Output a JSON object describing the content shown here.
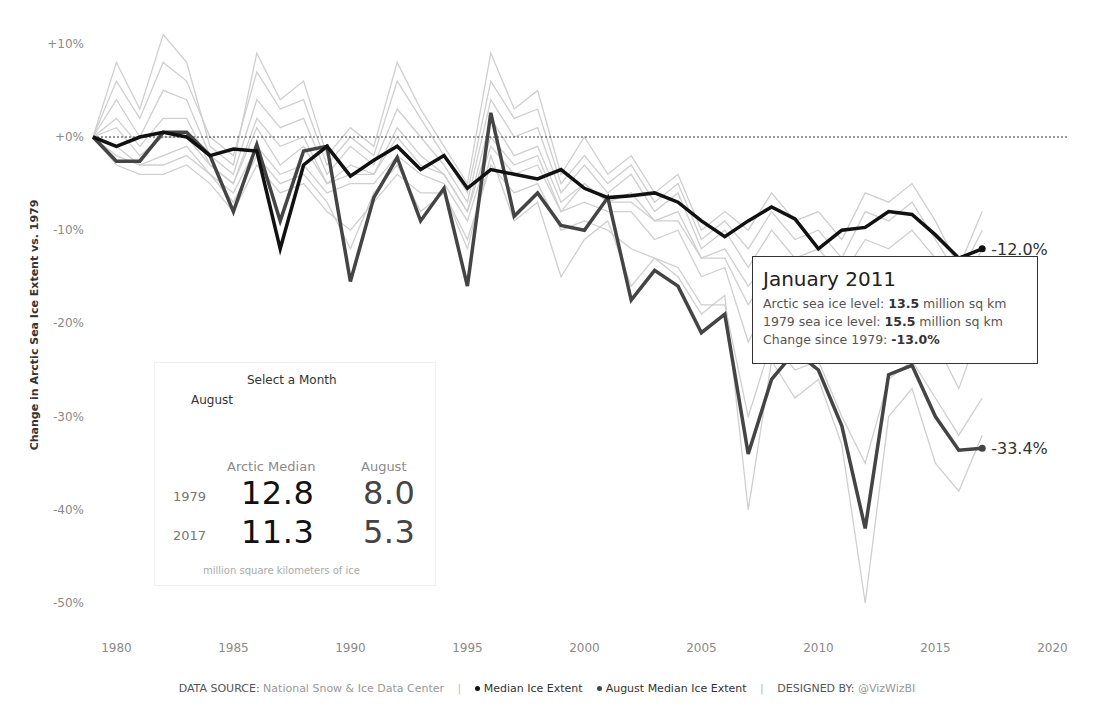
{
  "chart_data": {
    "type": "line",
    "title": "",
    "xlabel": "",
    "ylabel": "Change in Arctic Sea Ice Extent vs. 1979",
    "xlim": [
      1979,
      2020
    ],
    "ylim": [
      -50,
      10
    ],
    "grid": false,
    "reference_line": {
      "y": 0,
      "style": "dotted"
    },
    "x_ticks": [
      "1980",
      "1985",
      "1990",
      "1995",
      "2000",
      "2005",
      "2010",
      "2015",
      "2020"
    ],
    "y_ticks": [
      "+10%",
      "+0%",
      "-10%",
      "-20%",
      "-30%",
      "-40%",
      "-50%"
    ],
    "x": [
      1979,
      1980,
      1981,
      1982,
      1983,
      1984,
      1985,
      1986,
      1987,
      1988,
      1989,
      1990,
      1991,
      1992,
      1993,
      1994,
      1995,
      1996,
      1997,
      1998,
      1999,
      2000,
      2001,
      2002,
      2003,
      2004,
      2005,
      2006,
      2007,
      2008,
      2009,
      2010,
      2011,
      2012,
      2013,
      2014,
      2015,
      2016,
      2017
    ],
    "series": [
      {
        "name": "Median Ice Extent",
        "color": "#111111",
        "width": 3.5,
        "end_label": "-12.0%",
        "values": [
          0,
          -1,
          0,
          0.5,
          0,
          -2,
          -1.3,
          -1.5,
          -12,
          -3,
          -1,
          -4.2,
          -2.5,
          -1,
          -3.5,
          -2,
          -5.5,
          -3.5,
          -4,
          -4.5,
          -3.5,
          -5.5,
          -6.5,
          -6.3,
          -6,
          -7,
          -9,
          -10.7,
          -9,
          -7.5,
          -8.8,
          -12,
          -10,
          -9.7,
          -8,
          -8.3,
          -10.5,
          -13,
          -12
        ]
      },
      {
        "name": "August Median Ice Extent",
        "color": "#444444",
        "width": 3.5,
        "end_label": "-33.4%",
        "values": [
          0,
          -2.6,
          -2.6,
          0.5,
          0.5,
          -2,
          -8,
          -0.8,
          -9,
          -1.5,
          -1,
          -15.5,
          -6.5,
          -2.2,
          -9,
          -5.5,
          -16,
          2.6,
          -8.5,
          -6,
          -9.5,
          -10,
          -6.5,
          -17.5,
          -14.3,
          -16,
          -21,
          -19,
          -34,
          -26,
          -23,
          -25,
          -31,
          -42,
          -25.5,
          -24.5,
          -30,
          -33.6,
          -33.4
        ]
      }
    ],
    "background_series_color": "#cfcfcf",
    "background_series": [
      {
        "name": "other-month-1",
        "values": [
          0,
          8,
          3,
          11,
          8,
          -1,
          -3,
          9,
          4,
          6,
          -2,
          1,
          -1,
          8,
          3,
          -1,
          -5,
          9,
          3,
          5,
          -4,
          0,
          -4,
          -2,
          -6,
          -4,
          -10,
          -8,
          -10,
          -6,
          -9,
          -8,
          -11,
          -6,
          -7,
          -5,
          -9,
          -14,
          -8
        ]
      },
      {
        "name": "other-month-2",
        "values": [
          0,
          6,
          2,
          8,
          6,
          0,
          -2,
          7,
          3,
          4,
          -3,
          0,
          -2,
          6,
          2,
          -2,
          -6,
          6,
          2,
          3,
          -5,
          -2,
          -5,
          -3,
          -7,
          -5,
          -11,
          -9,
          -12,
          -8,
          -11,
          -10,
          -13,
          -8,
          -9,
          -7,
          -11,
          -15,
          -10
        ]
      },
      {
        "name": "other-month-3",
        "values": [
          0,
          4,
          0,
          5,
          4,
          -2,
          -4,
          4,
          1,
          2,
          -4,
          -1,
          -3,
          3,
          0,
          -3,
          -7,
          4,
          0,
          1,
          -6,
          -3,
          -6,
          -4,
          -8,
          -6,
          -12,
          -10,
          -14,
          -10,
          -13,
          -12,
          -15,
          -11,
          -12,
          -10,
          -13,
          -17,
          -12
        ]
      },
      {
        "name": "other-month-4",
        "values": [
          0,
          2,
          -1,
          2,
          2,
          -3,
          -5,
          2,
          -1,
          0,
          -5,
          -3,
          -4,
          1,
          -2,
          -4,
          -8,
          2,
          -2,
          -1,
          -7,
          -5,
          -7,
          -6,
          -9,
          -8,
          -13,
          -12,
          -16,
          -13,
          -15,
          -14,
          -18,
          -14,
          -15,
          -13,
          -16,
          -20,
          -15
        ]
      },
      {
        "name": "other-month-5",
        "values": [
          0,
          -1,
          -3,
          -2,
          -1,
          -4,
          -6,
          -1,
          -4,
          -3,
          -6,
          -5,
          -5,
          -2,
          -4,
          -5,
          -9,
          -1,
          -4,
          -3,
          -8,
          -7,
          -8,
          -8,
          -11,
          -10,
          -15,
          -14,
          -22,
          -17,
          -19,
          -18,
          -23,
          -20,
          -20,
          -18,
          -22,
          -27,
          -20
        ]
      },
      {
        "name": "other-month-6",
        "values": [
          0,
          -3,
          -4,
          -4,
          -3,
          -5,
          -8,
          -3,
          -6,
          -5,
          -8,
          -10,
          -7,
          -4,
          -6,
          -6,
          -11,
          -3,
          -6,
          -5,
          -10,
          -9,
          -10,
          -12,
          -13,
          -14,
          -18,
          -18,
          -30,
          -22,
          -25,
          -24,
          -30,
          -35,
          -26,
          -24,
          -28,
          -32,
          -28
        ]
      },
      {
        "name": "other-month-7",
        "values": [
          0,
          -2,
          -3,
          -3,
          -2,
          -4,
          -7,
          -2,
          -5,
          -4,
          -7,
          -12,
          -6,
          -3,
          -8,
          -6,
          -12,
          -2,
          -9,
          -7,
          -15,
          -11,
          -9,
          -16,
          -13,
          -15,
          -19,
          -17,
          -40,
          -24,
          -28,
          -26,
          -33,
          -50,
          -30,
          -27,
          -35,
          -38,
          -32
        ]
      },
      {
        "name": "other-month-8",
        "values": [
          0,
          1,
          -2,
          0,
          0,
          -3,
          -5,
          1,
          -3,
          -1,
          -5,
          -4,
          -4,
          0,
          -3,
          -4,
          -8,
          0,
          -3,
          -2,
          -8,
          -5,
          -7,
          -7,
          -9,
          -9,
          -13,
          -13,
          -18,
          -14,
          -17,
          -15,
          -19,
          -16,
          -17,
          -14,
          -18,
          -22,
          -17
        ]
      }
    ]
  },
  "axis": {
    "y_title": "Change in Arctic Sea Ice Extent vs. 1979"
  },
  "end_labels": {
    "median": "-12.0%",
    "august": "-33.4%"
  },
  "panel": {
    "title": "Select a Month",
    "selected_month": "August",
    "col_headers": [
      "Arctic Median",
      "August"
    ],
    "rows": [
      {
        "year": "1979",
        "median": "12.8",
        "month": "8.0"
      },
      {
        "year": "2017",
        "median": "11.3",
        "month": "5.3"
      }
    ],
    "units": "million square kilometers of ice"
  },
  "tooltip": {
    "title": "January 2011",
    "line1_prefix": "Arctic sea ice level: ",
    "line1_value": "13.5",
    "line1_suffix": " million sq km",
    "line2_prefix": "1979 sea ice level: ",
    "line2_value": "15.5",
    "line2_suffix": " million sq km",
    "line3_prefix": "Change since 1979: ",
    "line3_value": "-13.0%"
  },
  "footer": {
    "source_label": "DATA SOURCE:",
    "source_value": "National Snow & Ice Data Center",
    "legend_median": "Median Ice Extent",
    "legend_august": "August Median Ice Extent",
    "designed_label": "DESIGNED BY:",
    "designed_value": "@VizWizBI",
    "separator": "|"
  },
  "colors": {
    "median": "#111111",
    "august": "#444444",
    "background": "#cfcfcf"
  }
}
